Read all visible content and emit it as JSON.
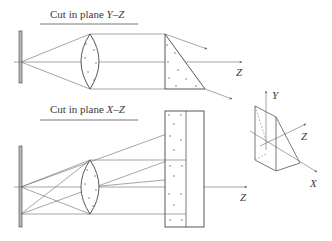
{
  "top_panel": {
    "title_prefix": "Cut in plane ",
    "title_var": "Y–Z",
    "axis_label": "Z"
  },
  "bottom_panel": {
    "title_prefix": "Cut in plane ",
    "title_var": "X–Z",
    "axis_label": "Z"
  },
  "prism_3d": {
    "axis_y": "Y",
    "axis_z": "Z",
    "axis_x": "X"
  },
  "colors": {
    "line": "#555555",
    "text": "#3a3a3a",
    "background": "#ffffff"
  }
}
